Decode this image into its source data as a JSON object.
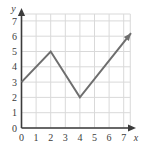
{
  "chart_data": {
    "type": "line",
    "title": "",
    "xlabel": "x",
    "ylabel": "y",
    "xlim": [
      0,
      7.6
    ],
    "ylim": [
      0,
      7.4
    ],
    "xticks": [
      "0",
      "1",
      "2",
      "3",
      "4",
      "5",
      "6",
      "7"
    ],
    "yticks": [
      "0",
      "1",
      "2",
      "3",
      "4",
      "5",
      "6",
      "7"
    ],
    "xtick_values": [
      0,
      1,
      2,
      3,
      4,
      5,
      6,
      7
    ],
    "ytick_values": [
      0,
      1,
      2,
      3,
      4,
      5,
      6,
      7
    ],
    "grid": true,
    "legend": null,
    "series": [
      {
        "name": "piecewise-linear-graph",
        "x": [
          0,
          2,
          4,
          7.5
        ],
        "y": [
          3,
          5,
          2,
          6.2
        ],
        "arrow_end": true,
        "color": "#6e6e6e"
      }
    ],
    "annotations": [],
    "colors": {
      "line": "#6e6e6e",
      "grid": "#d9d9d9",
      "axis": "#3b3b3b",
      "background": "#ffffff",
      "tick_label": "#3b3b3b"
    }
  },
  "axes": {
    "x_axis_label": "x",
    "y_axis_label": "y"
  }
}
